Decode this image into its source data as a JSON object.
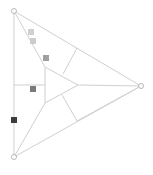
{
  "diagram": {
    "outer_triangle": {
      "vertices": [
        {
          "name": "top",
          "x": 14,
          "y": 11
        },
        {
          "name": "right",
          "x": 141,
          "y": 86
        },
        {
          "name": "bottom",
          "x": 14,
          "y": 157
        }
      ]
    },
    "inner_triangle": {
      "vertices": [
        {
          "name": "top",
          "x": 45,
          "y": 67
        },
        {
          "name": "right",
          "x": 78,
          "y": 85
        },
        {
          "name": "bottom",
          "x": 45,
          "y": 103
        }
      ]
    },
    "segments": [
      {
        "x1": 14,
        "y1": 11,
        "x2": 45,
        "y2": 67
      },
      {
        "x1": 45,
        "y1": 67,
        "x2": 45,
        "y2": 103
      },
      {
        "x1": 45,
        "y1": 103,
        "x2": 14,
        "y2": 157
      },
      {
        "x1": 45,
        "y1": 67,
        "x2": 78,
        "y2": 85
      },
      {
        "x1": 78,
        "y1": 85,
        "x2": 45,
        "y2": 103
      },
      {
        "x1": 78,
        "y1": 85,
        "x2": 141,
        "y2": 86
      },
      {
        "x1": 14,
        "y1": 85,
        "x2": 45,
        "y2": 85
      },
      {
        "x1": 77,
        "y1": 48,
        "x2": 63,
        "y2": 74
      },
      {
        "x1": 62,
        "y1": 95,
        "x2": 77,
        "y2": 121
      },
      {
        "x1": 77,
        "y1": 121,
        "x2": 141,
        "y2": 86
      }
    ],
    "markers": [
      {
        "x": 31,
        "y": 32,
        "color": "#d0d0d0"
      },
      {
        "x": 33,
        "y": 41,
        "color": "#cccccc"
      },
      {
        "x": 46,
        "y": 58,
        "color": "#a0a0a0"
      },
      {
        "x": 33,
        "y": 89,
        "color": "#7a7a7a"
      },
      {
        "x": 14,
        "y": 120,
        "color": "#3c3c3c"
      }
    ],
    "marker_size": 6
  }
}
